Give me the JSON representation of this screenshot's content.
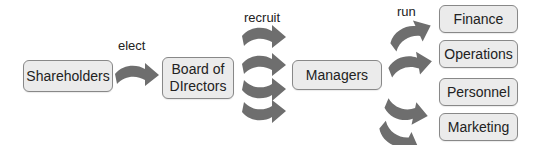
{
  "diagram": {
    "type": "org-flow",
    "nodes": {
      "shareholders": "Shareholders",
      "board": "Board of DIrectors",
      "board_line1": "Board of",
      "board_line2": "DIrectors",
      "managers": "Managers",
      "finance": "Finance",
      "operations": "Operations",
      "personnel": "Personnel",
      "marketing": "Marketing"
    },
    "edge_labels": {
      "elect": "elect",
      "recruit": "recruit",
      "run": "run"
    },
    "edges": [
      {
        "from": "Shareholders",
        "to": "Board of DIrectors",
        "label": "elect"
      },
      {
        "from": "Board of DIrectors",
        "to": "Managers",
        "label": "recruit",
        "arrow_count": 4
      },
      {
        "from": "Managers",
        "to": "Finance",
        "label": "run"
      },
      {
        "from": "Managers",
        "to": "Operations",
        "label": "run"
      },
      {
        "from": "Managers",
        "to": "Personnel",
        "label": "run"
      },
      {
        "from": "Managers",
        "to": "Marketing",
        "label": "run"
      }
    ],
    "colors": {
      "box_fill": "#ebebeb",
      "box_border": "#888888",
      "arrow": "#6e6e6e"
    }
  }
}
